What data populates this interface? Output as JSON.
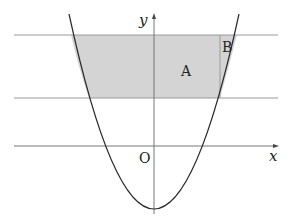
{
  "diagram": {
    "type": "parabola-area-diagram",
    "labels": {
      "y_axis": "y",
      "x_axis": "x",
      "origin": "O",
      "region_a": "A",
      "region_b": "B"
    },
    "colors": {
      "shade": "#d4d4d4",
      "curve": "#2a2a2a",
      "lines": "#9a9a9a",
      "axes": "#555555"
    }
  }
}
